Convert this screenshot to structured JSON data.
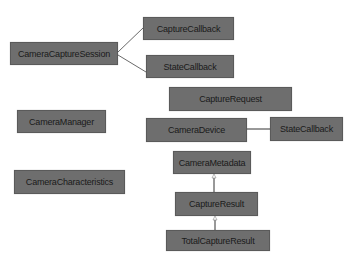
{
  "diagram": {
    "type": "class-relationship-diagram",
    "nodes": {
      "camera_capture_session": {
        "label": "CameraCaptureSession"
      },
      "capture_callback": {
        "label": "CaptureCallback"
      },
      "state_callback_session": {
        "label": "StateCallback"
      },
      "capture_request": {
        "label": "CaptureRequest"
      },
      "camera_manager": {
        "label": "CameraManager"
      },
      "camera_device": {
        "label": "CameraDevice"
      },
      "state_callback_device": {
        "label": "StateCallback"
      },
      "camera_metadata": {
        "label": "CameraMetadata"
      },
      "camera_characteristics": {
        "label": "CameraCharacteristics"
      },
      "capture_result": {
        "label": "CaptureResult"
      },
      "total_capture_result": {
        "label": "TotalCaptureResult"
      }
    },
    "edges": [
      {
        "from": "CameraCaptureSession",
        "to": "CaptureCallback",
        "type": "association"
      },
      {
        "from": "CameraCaptureSession",
        "to": "StateCallback",
        "type": "association"
      },
      {
        "from": "CameraDevice",
        "to": "StateCallback",
        "type": "association"
      },
      {
        "from": "CaptureResult",
        "to": "CameraMetadata",
        "type": "inheritance"
      },
      {
        "from": "TotalCaptureResult",
        "to": "CaptureResult",
        "type": "inheritance"
      }
    ],
    "colors": {
      "node_fill": "#6e6e6e",
      "node_text": "#1a1a1a",
      "edge": "#555555",
      "background": "#ffffff"
    }
  }
}
